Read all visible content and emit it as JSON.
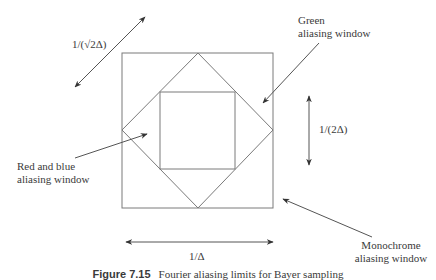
{
  "diagram": {
    "line_color": "#7a7a7a",
    "text_color": "#3a3a3a",
    "shapes": {
      "monochrome_square": {
        "x1": 122,
        "y1": 53,
        "x2": 273,
        "y2": 208
      },
      "green_diamond": {
        "top": [
          198,
          53
        ],
        "right": [
          273,
          130
        ],
        "bottom": [
          198,
          208
        ],
        "left": [
          122,
          130
        ]
      },
      "red_blue_square": {
        "x1": 160,
        "y1": 92,
        "x2": 235,
        "y2": 169
      }
    },
    "dimensions": {
      "diagonal": {
        "label": "1/(√2Δ)",
        "from": [
          75,
          87
        ],
        "to": [
          145,
          17
        ]
      },
      "vertical": {
        "label": "1/(2Δ)",
        "from": [
          309,
          96
        ],
        "to": [
          309,
          165
        ]
      },
      "horizontal": {
        "label": "1/Δ",
        "from": [
          126,
          242
        ],
        "to": [
          273,
          242
        ]
      }
    },
    "callouts": {
      "green": {
        "line1": "Green",
        "line2": "aliasing window"
      },
      "red_blue": {
        "line1": "Red and blue",
        "line2": "aliasing window"
      },
      "monochrome": {
        "line1": "Monochrome",
        "line2": "aliasing window"
      }
    },
    "caption": {
      "label": "Figure 7.15",
      "text": "Fourier aliasing limits for Bayer sampling"
    }
  }
}
